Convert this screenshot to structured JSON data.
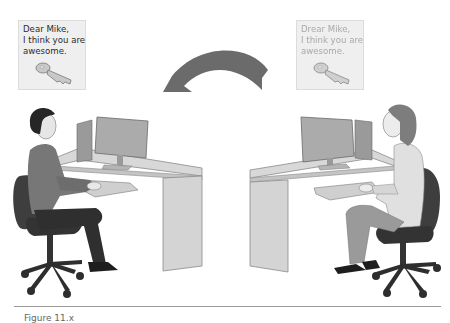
{
  "figure": {
    "sender_note": {
      "lines": [
        "Dear Mike,",
        "I think you are",
        "awesome."
      ],
      "icon": "key-icon"
    },
    "receiver_note": {
      "lines": [
        "Drear Mike,",
        "I think you are",
        "awesome."
      ],
      "style": "faded",
      "icon": "key-icon"
    },
    "arrow": {
      "direction": "right-to-left",
      "icon": "curved-arrow-left-icon"
    },
    "left_person": "man-at-desk",
    "right_person": "woman-at-desk",
    "caption": "Figure 11.x"
  },
  "colors": {
    "note_bg": "#efefef",
    "arrow": "#6b6b6b",
    "desk": "#d6d6d6",
    "monitor": "#a9a9a9",
    "chair": "#3c3c3c",
    "divider": "#9a9a9a"
  }
}
